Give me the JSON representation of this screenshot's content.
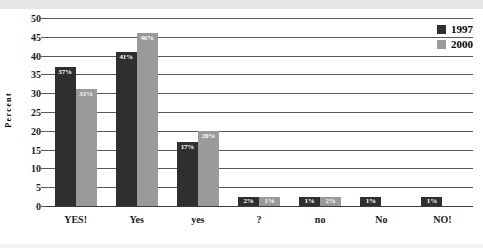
{
  "chart_data": {
    "type": "bar",
    "title": "",
    "xlabel": "",
    "ylabel": "Percent",
    "ylim": [
      0,
      50
    ],
    "ytick_step": 5,
    "yticks": [
      50,
      45,
      40,
      35,
      30,
      25,
      20,
      15,
      10,
      5,
      0
    ],
    "grid": true,
    "legend_position": "top-right",
    "categories": [
      "YES!",
      "Yes",
      "yes",
      "?",
      "no",
      "No",
      "NO!"
    ],
    "series": [
      {
        "name": "1997",
        "color": "#2f2f2f",
        "values": [
          37,
          41,
          17,
          2,
          1,
          1,
          1
        ],
        "labels": [
          "37%",
          "41%",
          "17%",
          "2%",
          "1%",
          "1%",
          "1%"
        ]
      },
      {
        "name": "2000",
        "color": "#9a9a9a",
        "values": [
          31,
          46,
          20,
          1,
          2,
          null,
          null
        ],
        "labels": [
          "31%",
          "46%",
          "20%",
          "1%",
          "2%",
          "",
          ""
        ]
      }
    ]
  },
  "legend": {
    "items": [
      {
        "label": "1997",
        "swatch": "legend-swatch-1997"
      },
      {
        "label": "2000",
        "swatch": "legend-swatch-2000"
      }
    ]
  },
  "axis": {
    "y_label": "Percent"
  }
}
